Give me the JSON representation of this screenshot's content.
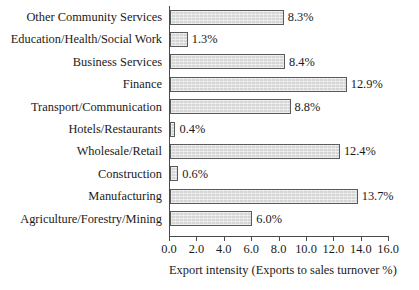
{
  "chart_data": {
    "type": "bar",
    "orientation": "horizontal",
    "title": "",
    "xlabel": "Export intensity (Exports to sales turnover %)",
    "ylabel": "",
    "xlim": [
      0.0,
      16.0
    ],
    "xtick_step": 2.0,
    "grid": false,
    "legend": null,
    "bar_fill_color": "#d6d6d6",
    "bar_border_color": "#5a5a5a",
    "axis_color": "#4a4a4a",
    "categories": [
      "Other Community Services",
      "Education/Health/Social Work",
      "Business Services",
      "Finance",
      "Transport/Communication",
      "Hotels/Restaurants",
      "Wholesale/Retail",
      "Construction",
      "Manufacturing",
      "Agriculture/Forestry/Mining"
    ],
    "values": [
      8.3,
      1.3,
      8.4,
      12.9,
      8.8,
      0.4,
      12.4,
      0.6,
      13.7,
      6.0
    ],
    "value_labels": [
      "8.3%",
      "1.3%",
      "8.4%",
      "12.9%",
      "8.8%",
      "0.4%",
      "12.4%",
      "0.6%",
      "13.7%",
      "6.0%"
    ],
    "xtick_labels": [
      "0.0",
      "2.0",
      "4.0",
      "6.0",
      "8.0",
      "10.0",
      "12.0",
      "14.0",
      "16.0"
    ],
    "xtick_values": [
      0.0,
      2.0,
      4.0,
      6.0,
      8.0,
      10.0,
      12.0,
      14.0,
      16.0
    ]
  }
}
